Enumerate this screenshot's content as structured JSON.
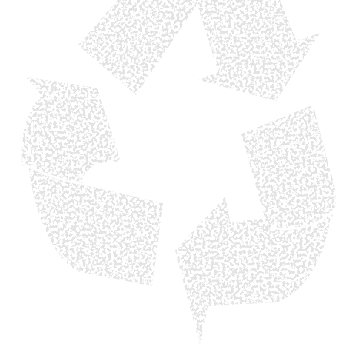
{
  "image": {
    "subject": "recycling symbol",
    "style": "grunge, distressed texture",
    "alt": "Grey distressed recycling symbol with three chasing arrows"
  },
  "colors": {
    "background": "#ffffff",
    "symbol_fill": "#e3e3e3",
    "texture_speckle": "#f6f6f6"
  },
  "arrows": [
    {
      "name": "top-arrow",
      "direction": "down-right"
    },
    {
      "name": "left-arrow",
      "direction": "up"
    },
    {
      "name": "right-arrow",
      "direction": "down-left"
    }
  ]
}
